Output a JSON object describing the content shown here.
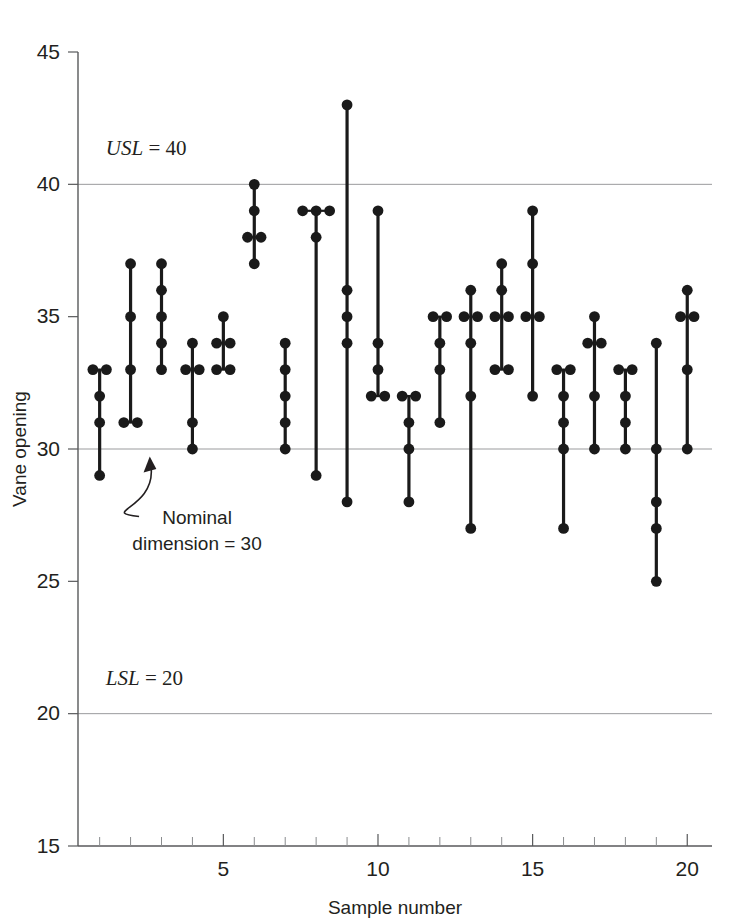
{
  "chart_data": {
    "type": "scatter",
    "title": "",
    "xlabel": "Sample number",
    "ylabel": "Vane opening",
    "xlim": [
      0.3,
      20.8
    ],
    "ylim": [
      15,
      45
    ],
    "ytick_values": [
      15,
      20,
      25,
      30,
      35,
      40,
      45
    ],
    "ytick_labels": [
      "15",
      "20",
      "25",
      "30",
      "35",
      "40",
      "45"
    ],
    "xtick_values": [
      5,
      10,
      15,
      20
    ],
    "xtick_labels": [
      "5",
      "10",
      "15",
      "20"
    ],
    "xtick_minor": [
      1,
      2,
      3,
      4,
      6,
      7,
      8,
      9,
      11,
      12,
      13,
      14,
      16,
      17,
      18,
      19
    ],
    "grid": "horizontal-at-spec-lines",
    "legend": "none",
    "reference_lines": [
      {
        "name": "USL",
        "label": "USL = 40",
        "value": 40,
        "label_x": 1.2,
        "label_y_offset": 1.1
      },
      {
        "name": "Nominal",
        "label": "",
        "value": 30
      },
      {
        "name": "LSL",
        "label": "LSL = 20",
        "value": 20,
        "label_x": 1.2,
        "label_y_offset": 1.1
      }
    ],
    "annotations": [
      {
        "name": "nominal-dimension-callout",
        "lines": [
          "Nominal",
          "dimension = 30"
        ],
        "text_x": 4.15,
        "text_y": 27.15,
        "arrow_tip_x": 2.62,
        "arrow_tip_y": 29.72
      }
    ],
    "categories": [
      1,
      2,
      3,
      4,
      5,
      6,
      7,
      8,
      9,
      10,
      11,
      12,
      13,
      14,
      15,
      16,
      17,
      18,
      19,
      20
    ],
    "series": [
      {
        "name": "Vane opening measurements",
        "samples": [
          {
            "sample": 1,
            "values": [
              33,
              33,
              32,
              31,
              29
            ]
          },
          {
            "sample": 2,
            "values": [
              37,
              35,
              33,
              31,
              31
            ]
          },
          {
            "sample": 3,
            "values": [
              37,
              36,
              35,
              34,
              33
            ]
          },
          {
            "sample": 4,
            "values": [
              34,
              33,
              33,
              31,
              30
            ]
          },
          {
            "sample": 5,
            "values": [
              35,
              34,
              34,
              33,
              33
            ]
          },
          {
            "sample": 6,
            "values": [
              40,
              39,
              38,
              38,
              37
            ]
          },
          {
            "sample": 7,
            "values": [
              34,
              33,
              32,
              31,
              30
            ]
          },
          {
            "sample": 8,
            "values": [
              39,
              39,
              39,
              38,
              29
            ]
          },
          {
            "sample": 9,
            "values": [
              43,
              36,
              35,
              34,
              28
            ]
          },
          {
            "sample": 10,
            "values": [
              39,
              34,
              33,
              32,
              32
            ]
          },
          {
            "sample": 11,
            "values": [
              32,
              32,
              31,
              30,
              28
            ]
          },
          {
            "sample": 12,
            "values": [
              35,
              35,
              34,
              33,
              31
            ]
          },
          {
            "sample": 13,
            "values": [
              36,
              35,
              35,
              34,
              32,
              27
            ]
          },
          {
            "sample": 14,
            "values": [
              37,
              36,
              35,
              35,
              33,
              33
            ]
          },
          {
            "sample": 15,
            "values": [
              39,
              37,
              35,
              35,
              32
            ]
          },
          {
            "sample": 16,
            "values": [
              33,
              33,
              32,
              31,
              30,
              27
            ]
          },
          {
            "sample": 17,
            "values": [
              35,
              34,
              34,
              32,
              30
            ]
          },
          {
            "sample": 18,
            "values": [
              33,
              33,
              32,
              31,
              30
            ]
          },
          {
            "sample": 19,
            "values": [
              34,
              30,
              28,
              27,
              25
            ]
          },
          {
            "sample": 20,
            "values": [
              36,
              35,
              35,
              33,
              30
            ]
          }
        ]
      }
    ],
    "colors": {
      "marker": "#1a1a1a",
      "stem": "#1a1a1a",
      "axis": "#58595b",
      "gridline": "#9a9b9d",
      "text": "#231f20",
      "background": "#ffffff"
    }
  }
}
